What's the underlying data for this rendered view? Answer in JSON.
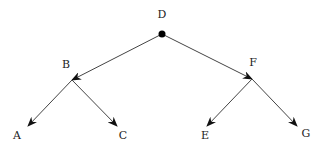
{
  "diagram": {
    "type": "tree",
    "root": "D",
    "colors": {
      "line": "#444444",
      "arrow": "#111111",
      "text": "#222222",
      "root_dot": "#000000",
      "background": "#ffffff"
    },
    "nodes": [
      {
        "id": "D",
        "label": "D"
      },
      {
        "id": "B",
        "label": "B"
      },
      {
        "id": "F",
        "label": "F"
      },
      {
        "id": "A",
        "label": "A"
      },
      {
        "id": "C",
        "label": "C"
      },
      {
        "id": "E",
        "label": "E"
      },
      {
        "id": "G",
        "label": "G"
      }
    ],
    "edges": [
      {
        "from": "D",
        "to": "B"
      },
      {
        "from": "D",
        "to": "F"
      },
      {
        "from": "B",
        "to": "A"
      },
      {
        "from": "B",
        "to": "C"
      },
      {
        "from": "F",
        "to": "E"
      },
      {
        "from": "F",
        "to": "G"
      }
    ]
  }
}
